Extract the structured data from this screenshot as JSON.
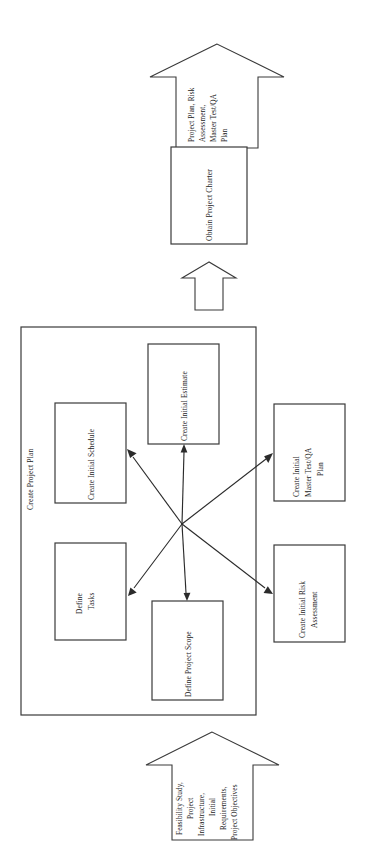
{
  "diagram": {
    "title_label": "Create Project Plan",
    "orientation": "rotated-90",
    "container": {
      "name": "Create Project Plan",
      "label": "Create Project Plan"
    },
    "input_arrow": {
      "name": "input-block-arrow",
      "lines": [
        "Feasibility Study,",
        "Project",
        "Infrastructure,",
        "Initial",
        "Requirements,",
        "Project Objectives"
      ],
      "text": "Feasibility Study, Project Infrastructure, Initial Requirements, Project Objectives"
    },
    "output_arrow": {
      "name": "output-block-arrow",
      "lines": [
        "Project Plan, Risk",
        "Assessment,",
        "Master Test/QA",
        "Plan"
      ],
      "text": "Project Plan, Risk Assessment, Master Test/QA Plan"
    },
    "flow_arrow": {
      "name": "flow-block-arrow",
      "label": ""
    },
    "charter_box": {
      "label": "Obtain Project Charter"
    },
    "processes": [
      {
        "id": "create-initial-estimate",
        "lines": [
          "Create Initial Estimate"
        ]
      },
      {
        "id": "create-initial-schedule",
        "lines": [
          "Create Initial Schedule"
        ]
      },
      {
        "id": "create-initial-master-test-qa-plan",
        "lines": [
          "Create Initial",
          "Master Test/QA",
          "Plan"
        ]
      },
      {
        "id": "define-tasks",
        "lines": [
          "Define",
          "Tasks"
        ]
      },
      {
        "id": "define-project-scope",
        "lines": [
          "Define Project Scope"
        ]
      },
      {
        "id": "create-initial-risk-assessment",
        "lines": [
          "Create Initial Risk",
          "Assessment"
        ]
      }
    ],
    "colors": {
      "stroke": "#3a3a3a",
      "connector": "#2b2b2b",
      "background": "#ffffff",
      "text": "#1a1a1a"
    }
  }
}
